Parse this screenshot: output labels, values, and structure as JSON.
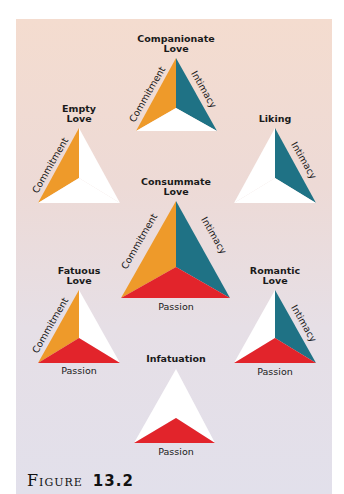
{
  "colors": {
    "commitment": "#ee9a2a",
    "intimacy": "#1f7285",
    "passion": "#e2242b",
    "empty": "#ffffff",
    "panel_top": "#f4dccf",
    "panel_bottom": "#e2e0eb"
  },
  "components": {
    "commitment": "Commitment",
    "intimacy": "Intimacy",
    "passion": "Passion"
  },
  "triangles": {
    "companionate": {
      "title_line1": "Companionate",
      "title_line2": "Love",
      "has": [
        "commitment",
        "intimacy"
      ]
    },
    "empty": {
      "title_line1": "Empty",
      "title_line2": "Love",
      "has": [
        "commitment"
      ]
    },
    "liking": {
      "title_line1": "Liking",
      "title_line2": "",
      "has": [
        "intimacy"
      ]
    },
    "consummate": {
      "title_line1": "Consummate",
      "title_line2": "Love",
      "has": [
        "commitment",
        "intimacy",
        "passion"
      ]
    },
    "fatuous": {
      "title_line1": "Fatuous",
      "title_line2": "Love",
      "has": [
        "commitment",
        "passion"
      ]
    },
    "romantic": {
      "title_line1": "Romantic",
      "title_line2": "Love",
      "has": [
        "intimacy",
        "passion"
      ]
    },
    "infatuation": {
      "title_line1": "Infatuation",
      "title_line2": "",
      "has": [
        "passion"
      ]
    }
  },
  "figure": {
    "label": "Figure",
    "number": "13.2"
  }
}
